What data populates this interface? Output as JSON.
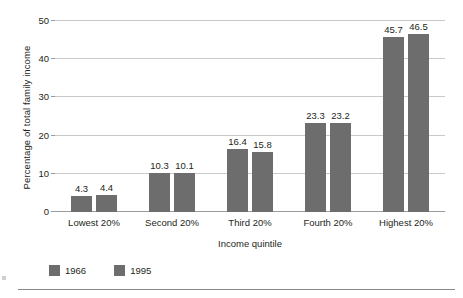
{
  "chart_data": {
    "type": "bar",
    "title": "",
    "subtitle": "",
    "xlabel": "Income quintile",
    "ylabel": "Percentage of total family income",
    "categories": [
      "Lowest 20%",
      "Second 20%",
      "Third 20%",
      "Fourth 20%",
      "Highest 20%"
    ],
    "series": [
      {
        "name": "1966",
        "color": "#6d6d6d",
        "values": [
          4.3,
          10.3,
          16.4,
          23.3,
          45.7
        ]
      },
      {
        "name": "1995",
        "color": "#6d6d6d",
        "values": [
          4.4,
          10.1,
          15.8,
          23.2,
          46.5
        ]
      }
    ],
    "value_labels": [
      [
        "4.3",
        "4.4"
      ],
      [
        "10.3",
        "10.1"
      ],
      [
        "16.4",
        "15.8"
      ],
      [
        "23.3",
        "23.2"
      ],
      [
        "45.7",
        "46.5"
      ]
    ],
    "ylim": [
      0,
      50
    ],
    "yticks": [
      0,
      10,
      20,
      30,
      40,
      50
    ],
    "ytick_labels": [
      "0",
      "10",
      "20",
      "30",
      "40",
      "50"
    ],
    "grid": "horizontal",
    "legend_position": "bottom-left",
    "bar_color": "#6d6d6d",
    "gridline_color": "#c9c9c9",
    "axis_color": "#9a9a9a"
  }
}
